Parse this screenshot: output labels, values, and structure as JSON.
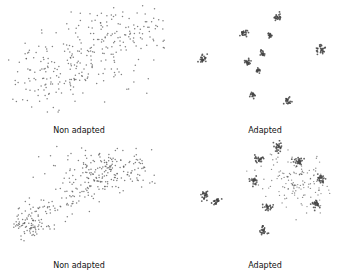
{
  "chart_data": [
    {
      "type": "scatter",
      "title": "",
      "caption": "Non adapted",
      "description": "t-SNE-style embedding, diffuse wide band of points with no distinct clusters",
      "point_color": "#555555",
      "regions": [
        {
          "name": "upper-right band",
          "cx": 0.72,
          "cy": 0.25,
          "sx": 0.16,
          "sy": 0.1,
          "n": 120
        },
        {
          "name": "middle spread",
          "cx": 0.45,
          "cy": 0.55,
          "sx": 0.2,
          "sy": 0.13,
          "n": 140
        },
        {
          "name": "lower-left tail",
          "cx": 0.25,
          "cy": 0.7,
          "sx": 0.1,
          "sy": 0.1,
          "n": 60
        }
      ]
    },
    {
      "type": "scatter",
      "title": "",
      "caption": "Adapted",
      "description": "embedding with compact, well-separated clusters",
      "point_color": "#444444",
      "clusters": [
        {
          "x": 0.62,
          "y": 0.14,
          "size": 0.7
        },
        {
          "x": 0.42,
          "y": 0.27,
          "size": 0.8
        },
        {
          "x": 0.57,
          "y": 0.29,
          "size": 0.3
        },
        {
          "x": 0.87,
          "y": 0.41,
          "size": 1.0
        },
        {
          "x": 0.53,
          "y": 0.44,
          "size": 0.4
        },
        {
          "x": 0.18,
          "y": 0.49,
          "size": 0.9
        },
        {
          "x": 0.44,
          "y": 0.52,
          "size": 0.6
        },
        {
          "x": 0.5,
          "y": 0.59,
          "size": 0.3
        },
        {
          "x": 0.47,
          "y": 0.79,
          "size": 0.5
        },
        {
          "x": 0.68,
          "y": 0.84,
          "size": 0.6
        }
      ]
    },
    {
      "type": "scatter",
      "title": "",
      "caption": "Non adapted",
      "description": "elongated diagonal band from lower-left to upper-right",
      "point_color": "#555555",
      "regions": [
        {
          "name": "upper cloud",
          "cx": 0.65,
          "cy": 0.22,
          "sx": 0.16,
          "sy": 0.09,
          "n": 150
        },
        {
          "name": "diagonal band",
          "cx": 0.38,
          "cy": 0.48,
          "sx": 0.07,
          "sy": 0.07,
          "n": 150,
          "diag": true
        },
        {
          "name": "lower-left tail",
          "cx": 0.18,
          "cy": 0.72,
          "sx": 0.06,
          "sy": 0.05,
          "n": 60
        }
      ]
    },
    {
      "type": "scatter",
      "title": "",
      "caption": "Adapted",
      "description": "several compact clusters around a central diffuse cloud",
      "point_color": "#444444",
      "clusters": [
        {
          "x": 0.62,
          "y": 0.06,
          "size": 1.0
        },
        {
          "x": 0.51,
          "y": 0.16,
          "size": 0.8
        },
        {
          "x": 0.74,
          "y": 0.18,
          "size": 1.0
        },
        {
          "x": 0.48,
          "y": 0.34,
          "size": 0.8
        },
        {
          "x": 0.87,
          "y": 0.32,
          "size": 0.9
        },
        {
          "x": 0.19,
          "y": 0.46,
          "size": 0.9
        },
        {
          "x": 0.26,
          "y": 0.51,
          "size": 0.8
        },
        {
          "x": 0.56,
          "y": 0.56,
          "size": 0.8
        },
        {
          "x": 0.53,
          "y": 0.76,
          "size": 0.8
        },
        {
          "x": 0.84,
          "y": 0.53,
          "size": 1.0
        }
      ],
      "diffuse": {
        "cx": 0.72,
        "cy": 0.35,
        "sx": 0.09,
        "sy": 0.12,
        "n": 140
      }
    }
  ]
}
